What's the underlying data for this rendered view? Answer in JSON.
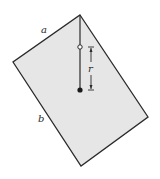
{
  "diagram": {
    "labels": {
      "side_a": "a",
      "side_b": "b",
      "distance": "r"
    },
    "colors": {
      "plate_fill": "#e6e6e6",
      "outline": "#2a2a2a",
      "background": "#ffffff"
    },
    "points": {
      "plate_corners": [
        [
          80,
          15
        ],
        [
          148,
          117
        ],
        [
          81,
          166
        ],
        [
          13,
          62
        ]
      ],
      "pivot": [
        80,
        15
      ],
      "open_circle": [
        80,
        47
      ],
      "center_of_mass": [
        80,
        90
      ]
    }
  }
}
